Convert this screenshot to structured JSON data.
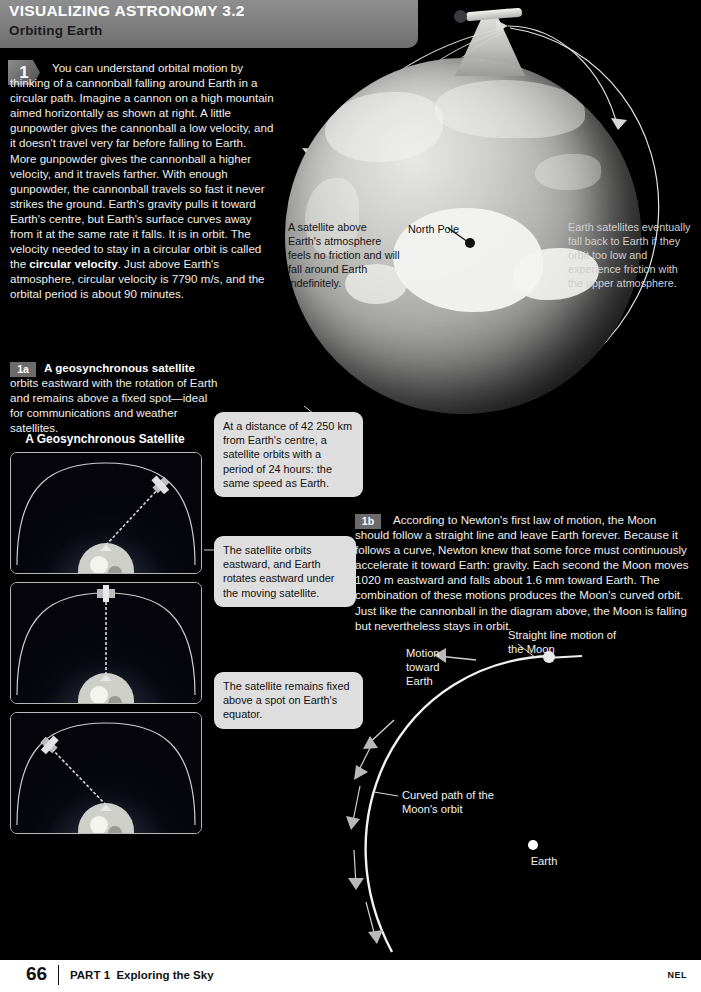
{
  "header": {
    "title": "VISUALIZING ASTRONOMY 3.2",
    "subtitle": "Orbiting Earth"
  },
  "sections": {
    "one": {
      "badge": "1",
      "text": "You can understand orbital motion by thinking of a cannonball falling around Earth in a circular path. Imagine a cannon on a high mountain aimed horizontally as shown at right. A little gunpowder gives the cannonball a low velocity, and it doesn't travel very far before falling to Earth. More gunpowder gives the cannonball a higher velocity, and it travels farther. With enough gunpowder, the cannonball travels so fast it never strikes the ground. Earth's gravity pulls it toward Earth's centre, but Earth's surface curves away from it at the same rate it falls. It is in orbit. The velocity needed to stay in a circular orbit is called the ",
      "bold_term": "circular velocity",
      "text_after": ". Just above Earth's atmosphere, circular velocity is 7790 m/s, and the orbital period is about 90 minutes."
    },
    "one_a": {
      "badge": "1a",
      "bold_term": "A geosynchronous satellite",
      "text_after": " orbits eastward with the rotation of Earth and remains above a fixed spot—ideal for communications and weather satellites.",
      "panel_title": "A Geosynchronous Satellite"
    },
    "one_b": {
      "badge": "1b",
      "text": "According to Newton's first law of motion, the Moon should follow a straight line and leave Earth forever. Because it follows a curve, Newton knew that some force must continuously accelerate it toward Earth: gravity. Each second the Moon moves 1020 m eastward and falls about 1.6 mm toward Earth. The combination of these motions produces the Moon's curved orbit. Just like the cannonball in the diagram above, the Moon is falling but nevertheless stays in orbit."
    }
  },
  "callouts": [
    {
      "id": "distance-period",
      "text": "At a distance of 42 250 km from Earth's centre, a satellite orbits with a period of 24 hours: the same speed as Earth."
    },
    {
      "id": "eastward-rotation",
      "text": "The satellite orbits eastward, and Earth rotates eastward under the moving satellite."
    },
    {
      "id": "fixed-above-equator",
      "text": "The satellite remains fixed above a spot on Earth's equator."
    }
  ],
  "globe_labels": {
    "satellite_above": "A satellite above Earth's atmosphere feels no friction and will fall around Earth indefinitely.",
    "north_pole": "North Pole",
    "fall_back": "Earth satellites eventually fall back to Earth if they orbit too low and experience friction with the upper atmosphere."
  },
  "moon_diagram": {
    "straight_line": "Straight line motion of the Moon",
    "motion_toward": "Motion toward Earth",
    "curved_path": "Curved path of the Moon's orbit",
    "earth": "Earth"
  },
  "footer": {
    "page_number": "66",
    "part": "PART 1",
    "part_title": "Exploring the Sky",
    "imprint": "NEL"
  },
  "colors": {
    "header_bar": "#7e7e7e",
    "callout_bg": "#dedede",
    "page_bg": "#000000",
    "footer_bg": "#ffffff"
  }
}
